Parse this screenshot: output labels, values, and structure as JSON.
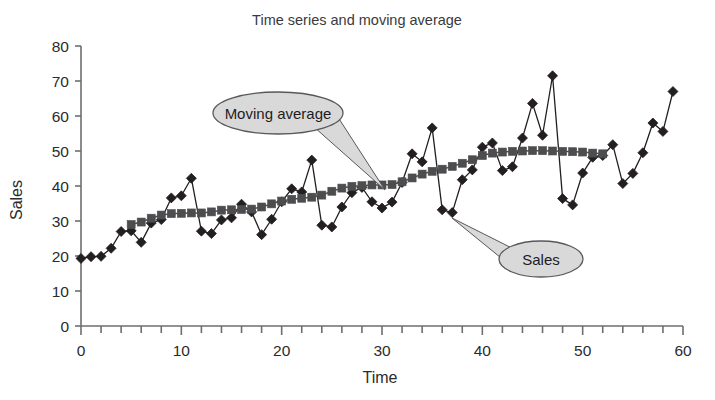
{
  "chart_data": {
    "type": "line",
    "title": "Time series and moving average",
    "xlabel": "Time",
    "ylabel": "Sales",
    "xlim": [
      0,
      60
    ],
    "ylim": [
      0,
      80
    ],
    "x_ticks": [
      0,
      10,
      20,
      30,
      40,
      50,
      60
    ],
    "x_tick_labels": [
      "0",
      "10",
      "20",
      "30",
      "40",
      "50",
      "60"
    ],
    "x_minor_tick_step": 2,
    "y_ticks": [
      0,
      10,
      20,
      30,
      40,
      50,
      60,
      70,
      80
    ],
    "y_tick_labels": [
      "0",
      "10",
      "20",
      "30",
      "40",
      "50",
      "60",
      "70",
      "80"
    ],
    "grid": false,
    "legend_position": "callouts",
    "x": [
      0,
      1,
      2,
      3,
      4,
      5,
      6,
      7,
      8,
      9,
      10,
      11,
      12,
      13,
      14,
      15,
      16,
      17,
      18,
      19,
      20,
      21,
      22,
      23,
      24,
      25,
      26,
      27,
      28,
      29,
      30,
      31,
      32,
      33,
      34,
      35,
      36,
      37,
      38,
      39,
      40,
      41,
      42,
      43,
      44,
      45,
      46,
      47,
      48,
      49,
      50,
      51,
      52,
      53,
      54,
      55,
      56,
      57,
      58,
      59
    ],
    "series": [
      {
        "name": "Sales",
        "marker": "diamond",
        "color": "#231f20",
        "values": [
          19.3,
          19.8,
          19.9,
          22.2,
          27.0,
          27.2,
          23.9,
          29.4,
          30.4,
          36.6,
          37.2,
          42.2,
          27.1,
          26.4,
          30.3,
          30.9,
          34.8,
          32.6,
          26.1,
          30.5,
          35.5,
          39.2,
          38.3,
          47.4,
          28.8,
          28.3,
          34.0,
          38.1,
          39.6,
          35.5,
          33.7,
          35.4,
          41.0,
          49.2,
          46.9,
          56.6,
          33.2,
          32.4,
          41.8,
          44.6,
          51.1,
          52.3,
          44.4,
          45.5,
          53.7,
          63.6,
          54.5,
          71.5,
          36.4,
          34.6,
          43.7,
          48.2,
          48.7,
          51.8,
          40.7,
          43.6,
          49.5,
          58.0,
          55.6,
          67.0
        ]
      },
      {
        "name": "Moving average",
        "marker": "square",
        "color": "#4d4d4f",
        "values": [
          null,
          null,
          null,
          null,
          null,
          29.0,
          29.7,
          30.8,
          31.7,
          32.1,
          32.2,
          32.3,
          32.3,
          32.6,
          33.1,
          33.2,
          33.3,
          33.4,
          34.0,
          34.9,
          35.7,
          36.2,
          36.5,
          36.8,
          37.4,
          38.5,
          39.4,
          39.9,
          40.1,
          40.3,
          40.3,
          40.4,
          41.2,
          42.3,
          43.4,
          44.2,
          44.8,
          45.6,
          46.5,
          47.5,
          48.7,
          49.4,
          49.7,
          49.9,
          50.0,
          50.1,
          50.1,
          50.0,
          49.9,
          49.8,
          49.7,
          49.4,
          49.2,
          null,
          null,
          null,
          null,
          null,
          null,
          null
        ]
      }
    ],
    "annotations": [
      {
        "label": "Moving average",
        "shape": "ellipse-callout",
        "center": [
          278,
          113
        ],
        "rx": 65,
        "ry": 21,
        "tail_tip": [
          385,
          190
        ],
        "fill": "#d9d9d9",
        "stroke": "#58585b"
      },
      {
        "label": "Sales",
        "shape": "ellipse-callout",
        "center": [
          541,
          259
        ],
        "rx": 42,
        "ry": 18,
        "tail_tip": [
          452,
          218
        ],
        "fill": "#d9d9d9",
        "stroke": "#58585b"
      }
    ]
  },
  "chart_style": {
    "background": "#ffffff",
    "axis_color": "#6d6e71",
    "text_color": "#231f20",
    "sales_color": "#231f20",
    "moving_average_color": "#4d4d4f",
    "callout_fill": "#d9d9d9"
  }
}
